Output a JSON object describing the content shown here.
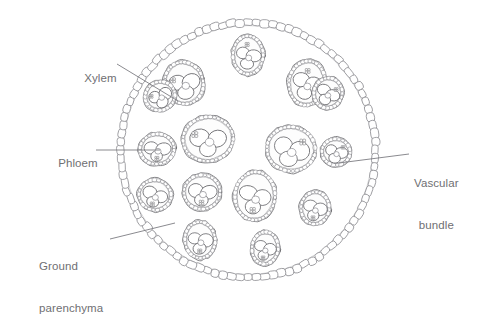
{
  "figure": {
    "background": "#ffffff",
    "ink_color": "#8a8a8f",
    "ink_color_dark": "#6f6f73",
    "text_color": "#6f6f73",
    "leader_color": "#7d7d82"
  },
  "labels": {
    "xylem": {
      "text": "Xylem",
      "x": 71,
      "y": 58
    },
    "phloem": {
      "text": "Phloem",
      "x": 45,
      "y": 143
    },
    "ground_parenchyma": {
      "line1": "Ground",
      "line2": "parenchyma",
      "x": 39,
      "y": 231
    },
    "vascular_bundle": {
      "line1": "Vascular",
      "line2": "bundle",
      "x": 414,
      "y": 148
    }
  },
  "leaders": [
    {
      "name": "xylem-leader",
      "x1": 117,
      "y1": 64,
      "x2": 178,
      "y2": 101
    },
    {
      "name": "phloem-leader",
      "x1": 96,
      "y1": 150,
      "x2": 160,
      "y2": 150
    },
    {
      "name": "ground-parenchyma-leader",
      "x1": 110,
      "y1": 239,
      "x2": 175,
      "y2": 223
    },
    {
      "name": "vascular-bundle-leader",
      "x1": 339,
      "y1": 163,
      "x2": 409,
      "y2": 154
    }
  ],
  "stem": {
    "center_x": 248,
    "center_y": 150,
    "radius": 131,
    "epidermis_cell_count": 96,
    "epidermis_cell_width": 9.2,
    "epidermis_cell_height": 7.2
  },
  "chart_data": {
    "type": "diagram",
    "annotations": [
      "Xylem",
      "Phloem",
      "Ground parenchyma",
      "Vascular bundle"
    ],
    "vascular_bundle_count": 15,
    "vascular_bundles": [
      {
        "id": 1,
        "cx": 248,
        "cy": 55,
        "rx": 17,
        "ry": 21,
        "rot": 0,
        "size": "small",
        "vessels": 3,
        "phloem": "top"
      },
      {
        "id": 2,
        "cx": 184,
        "cy": 83,
        "rx": 21,
        "ry": 23,
        "rot": -18,
        "size": "medium",
        "vessels": 3,
        "phloem": "left"
      },
      {
        "id": 3,
        "cx": 160,
        "cy": 96,
        "rx": 17,
        "ry": 16,
        "rot": -30,
        "size": "small",
        "vessels": 3,
        "phloem": "left"
      },
      {
        "id": 4,
        "cx": 307,
        "cy": 83,
        "rx": 20,
        "ry": 24,
        "rot": 8,
        "size": "medium",
        "vessels": 3,
        "phloem": "top"
      },
      {
        "id": 5,
        "cx": 328,
        "cy": 93,
        "rx": 16,
        "ry": 17,
        "rot": 18,
        "size": "small",
        "vessels": 3,
        "phloem": "right"
      },
      {
        "id": 6,
        "cx": 208,
        "cy": 139,
        "rx": 27,
        "ry": 24,
        "rot": -8,
        "size": "large",
        "vessels": 3,
        "phloem": "left"
      },
      {
        "id": 7,
        "cx": 291,
        "cy": 149,
        "rx": 26,
        "ry": 24,
        "rot": 6,
        "size": "large",
        "vessels": 3,
        "phloem": "right"
      },
      {
        "id": 8,
        "cx": 157,
        "cy": 149,
        "rx": 19,
        "ry": 17,
        "rot": -6,
        "size": "medium",
        "vessels": 3,
        "phloem": "bottom"
      },
      {
        "id": 9,
        "cx": 336,
        "cy": 152,
        "rx": 16,
        "ry": 15,
        "rot": 4,
        "size": "small",
        "vessels": 3,
        "phloem": "right"
      },
      {
        "id": 10,
        "cx": 155,
        "cy": 195,
        "rx": 18,
        "ry": 17,
        "rot": 10,
        "size": "medium",
        "vessels": 3,
        "phloem": "bottom"
      },
      {
        "id": 11,
        "cx": 202,
        "cy": 192,
        "rx": 20,
        "ry": 19,
        "rot": -4,
        "size": "medium",
        "vessels": 3,
        "phloem": "bottom"
      },
      {
        "id": 12,
        "cx": 255,
        "cy": 196,
        "rx": 22,
        "ry": 26,
        "rot": 4,
        "size": "large",
        "vessels": 3,
        "phloem": "bottom"
      },
      {
        "id": 13,
        "cx": 315,
        "cy": 208,
        "rx": 16,
        "ry": 18,
        "rot": 6,
        "size": "small",
        "vessels": 3,
        "phloem": "bottom"
      },
      {
        "id": 14,
        "cx": 200,
        "cy": 240,
        "rx": 17,
        "ry": 20,
        "rot": -4,
        "size": "small",
        "vessels": 3,
        "phloem": "bottom"
      },
      {
        "id": 15,
        "cx": 265,
        "cy": 248,
        "rx": 15,
        "ry": 18,
        "rot": 6,
        "size": "small",
        "vessels": 3,
        "phloem": "bottom"
      }
    ]
  }
}
